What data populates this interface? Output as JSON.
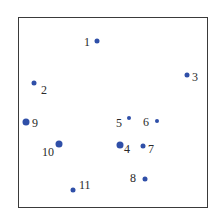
{
  "diagram": {
    "type": "numbered-point-plot",
    "point_color": "#2f4fa8",
    "points": [
      {
        "label": "1",
        "x": 97,
        "y": 41,
        "size": 5,
        "lx": 84,
        "ly": 36
      },
      {
        "label": "2",
        "x": 34,
        "y": 83,
        "size": 5,
        "lx": 41,
        "ly": 84
      },
      {
        "label": "3",
        "x": 187,
        "y": 75,
        "size": 5,
        "lx": 192,
        "ly": 71
      },
      {
        "label": "4",
        "x": 120,
        "y": 145,
        "size": 7,
        "lx": 124,
        "ly": 143
      },
      {
        "label": "5",
        "x": 129,
        "y": 118,
        "size": 4,
        "lx": 116,
        "ly": 117
      },
      {
        "label": "6",
        "x": 157,
        "y": 121,
        "size": 4,
        "lx": 143,
        "ly": 116
      },
      {
        "label": "7",
        "x": 143,
        "y": 146,
        "size": 5,
        "lx": 148,
        "ly": 143
      },
      {
        "label": "8",
        "x": 145,
        "y": 179,
        "size": 5,
        "lx": 130,
        "ly": 172
      },
      {
        "label": "9",
        "x": 26,
        "y": 122,
        "size": 7,
        "lx": 32,
        "ly": 117
      },
      {
        "label": "10",
        "x": 59,
        "y": 144,
        "size": 7,
        "lx": 42,
        "ly": 146
      },
      {
        "label": "11",
        "x": 73,
        "y": 190,
        "size": 5,
        "lx": 79,
        "ly": 179
      }
    ]
  }
}
